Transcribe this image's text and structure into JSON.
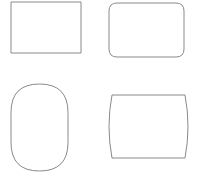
{
  "canvas": {
    "width": 203,
    "height": 179,
    "background_color": "#ffffff",
    "title": "Shapes"
  },
  "style": {
    "stroke_color": "#8a8a8a",
    "fill_color": "#ffffff",
    "stroke_width": 1
  },
  "shapes": [
    {
      "id": "rectangle",
      "name": "rectangle",
      "label": "Rectangle",
      "kind": "rect",
      "x": 11,
      "y": 2,
      "width": 70,
      "height": 51,
      "corner_radius": 0,
      "path": "M 11 2 L 81 2 L 81 53 L 11 53 Z"
    },
    {
      "id": "rounded-rectangle",
      "name": "rounded-rectangle",
      "label": "Rounded Rectangle",
      "kind": "rounded-rect",
      "x": 109,
      "y": 3,
      "width": 75,
      "height": 54,
      "corner_radius": 8,
      "path": "M 117 3 L 176 3 Q 184 3 184 11 L 184 49 Q 184 57 176 57 L 117 57 Q 109 57 109 49 L 109 11 Q 109 3 117 3 Z"
    },
    {
      "id": "stadium-oval",
      "name": "stadium-oval",
      "label": "Stadium / Oval",
      "kind": "stadium-vertical",
      "x": 11,
      "y": 84,
      "width": 57,
      "height": 87,
      "corner_radius": 28.5,
      "path": "M 11 112.5 Q 11 84 39.5 84 Q 68 84 68 112.5 L 68 142.5 Q 68 171 39.5 171 Q 11 171 11 142.5 Z"
    },
    {
      "id": "barrel",
      "name": "barrel",
      "label": "Barrel",
      "kind": "barrel",
      "x": 106,
      "y": 95,
      "width": 83,
      "height": 63,
      "bulge": 6,
      "path": "M 112 95 L 185 95 Q 191 126.5 185 158 L 112 158 Q 106 126.5 112 95 Z"
    }
  ]
}
